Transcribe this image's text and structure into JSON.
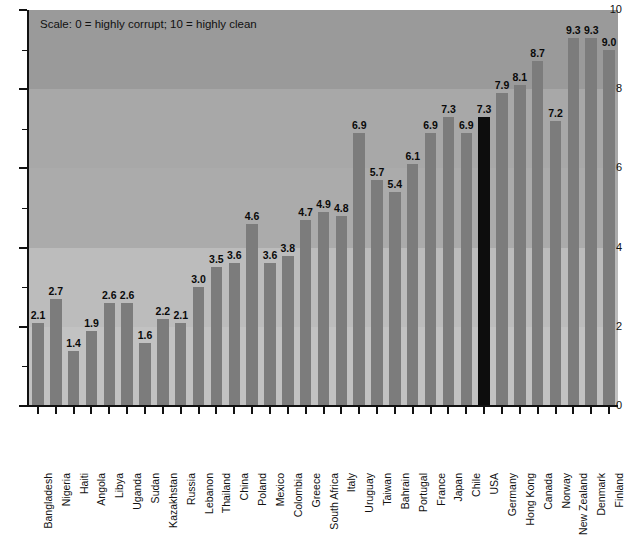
{
  "chart_data": {
    "type": "bar",
    "title": "",
    "annotation": "Scale: 0 = highly corrupt; 10 = highly clean",
    "xlabel": "",
    "ylabel": "",
    "ylim": [
      0,
      10
    ],
    "ytick_labels": [
      "0",
      "2",
      "4",
      "6",
      "8",
      "10"
    ],
    "ytick_values": [
      0,
      2,
      4,
      6,
      8,
      10
    ],
    "yminor_values": [
      1,
      3,
      5,
      7,
      9
    ],
    "grid": false,
    "legend": "none",
    "bar_color": "#7c7c7c",
    "highlight_color": "#0d0d0d",
    "highlight_category": "USA",
    "background_bands": [
      {
        "from": 8,
        "to": 10,
        "color": "#9a9a9a"
      },
      {
        "from": 6,
        "to": 8,
        "color": "#a8a8a8"
      },
      {
        "from": 4,
        "to": 6,
        "color": "#ababab"
      },
      {
        "from": 2,
        "to": 4,
        "color": "#bcbcbc"
      },
      {
        "from": 0,
        "to": 2,
        "color": "#c2c2c2"
      }
    ],
    "categories": [
      "Bangladesh",
      "Nigeria",
      "Haiti",
      "Angola",
      "Libya",
      "Uganda",
      "Sudan",
      "Kazakhstan",
      "Russia",
      "Lebanon",
      "Thailand",
      "China",
      "Poland",
      "Mexico",
      "Colombia",
      "Greece",
      "South Africa",
      "Italy",
      "Uruguay",
      "Taiwan",
      "Bahrain",
      "Portugal",
      "France",
      "Japan",
      "Chile",
      "USA",
      "Germany",
      "Hong Kong",
      "Canada",
      "Norway",
      "New Zealand",
      "Denmark",
      "Finland"
    ],
    "values": [
      2.1,
      2.7,
      1.4,
      1.9,
      2.6,
      2.6,
      1.6,
      2.2,
      2.1,
      3.0,
      3.5,
      3.6,
      4.6,
      3.6,
      3.8,
      4.7,
      4.9,
      4.8,
      6.9,
      5.7,
      5.4,
      6.1,
      6.9,
      7.3,
      6.9,
      7.3,
      7.9,
      8.1,
      8.7,
      7.2,
      9.3,
      9.3,
      9.0
    ],
    "value_labels": [
      "2.1",
      "2.7",
      "1.4",
      "1.9",
      "2.6",
      "2.6",
      "1.6",
      "2.2",
      "2.1",
      "3.0",
      "3.5",
      "3.6",
      "4.6",
      "3.6",
      "3.8",
      "4.7",
      "4.9",
      "4.8",
      "6.9",
      "5.7",
      "5.4",
      "6.1",
      "6.9",
      "7.3",
      "6.9",
      "7.3",
      "7.9",
      "8.1",
      "8.7",
      "7.2",
      "9.3",
      "9.3",
      "9.0"
    ]
  }
}
